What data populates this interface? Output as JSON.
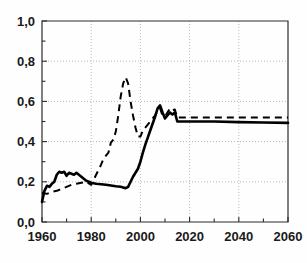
{
  "chart_data": {
    "type": "line",
    "title": "",
    "xlabel": "",
    "ylabel": "",
    "xlim": [
      1960,
      2060
    ],
    "ylim": [
      0.0,
      1.0
    ],
    "grid": true,
    "legend": "none",
    "decimal_separator": ",",
    "xticks": [
      1960,
      1980,
      2000,
      2020,
      2040,
      2060
    ],
    "xtick_labels": [
      "1960",
      "1980",
      "2000",
      "2020",
      "2040",
      "2060"
    ],
    "xminor_ticks": [
      1970,
      1990,
      2010,
      2030,
      2050
    ],
    "yticks": [
      0.0,
      0.2,
      0.4,
      0.6,
      0.8,
      1.0
    ],
    "ytick_labels": [
      "0,0",
      "0,2",
      "0,4",
      "0,6",
      "0,8",
      "1,0"
    ],
    "yminor_ticks": [
      0.1,
      0.3,
      0.5,
      0.7,
      0.9
    ],
    "gridlines_x": [
      1980,
      2000,
      2020,
      2040
    ],
    "gridlines_y": [
      0.2,
      0.4,
      0.6,
      0.8
    ],
    "series": [
      {
        "name": "solid-series",
        "style": "solid",
        "color": "#000000",
        "x": [
          1960,
          1961,
          1962,
          1963,
          1964,
          1965,
          1966,
          1967,
          1968,
          1969,
          1970,
          1971,
          1972,
          1973,
          1974,
          1975,
          1976,
          1977,
          1978,
          1979,
          1980,
          1982,
          1984,
          1986,
          1988,
          1990,
          1992,
          1993,
          1994,
          1995,
          1996,
          1997,
          1998,
          1999,
          2000,
          2001,
          2002,
          2003,
          2004,
          2005,
          2006,
          2007,
          2008,
          2009,
          2010,
          2011,
          2012,
          2013,
          2014,
          2015,
          2016,
          2020,
          2030,
          2040,
          2050,
          2060
        ],
        "y": [
          0.1,
          0.155,
          0.18,
          0.175,
          0.19,
          0.2,
          0.235,
          0.25,
          0.245,
          0.25,
          0.23,
          0.245,
          0.24,
          0.235,
          0.245,
          0.235,
          0.225,
          0.215,
          0.205,
          0.2,
          0.195,
          0.19,
          0.188,
          0.185,
          0.182,
          0.178,
          0.175,
          0.172,
          0.168,
          0.175,
          0.2,
          0.225,
          0.245,
          0.265,
          0.3,
          0.345,
          0.385,
          0.42,
          0.455,
          0.49,
          0.525,
          0.565,
          0.58,
          0.545,
          0.515,
          0.53,
          0.545,
          0.535,
          0.545,
          0.5,
          0.5,
          0.5,
          0.5,
          0.497,
          0.495,
          0.493
        ]
      },
      {
        "name": "dashed-series",
        "style": "dashed",
        "color": "#000000",
        "x": [
          1960,
          1962,
          1964,
          1966,
          1968,
          1970,
          1972,
          1974,
          1976,
          1978,
          1980,
          1982,
          1984,
          1985,
          1986,
          1987,
          1988,
          1989,
          1990,
          1991,
          1992,
          1993,
          1994,
          1995,
          1996,
          1997,
          1998,
          1999,
          2000,
          2001,
          2002,
          2003,
          2004,
          2005,
          2006,
          2007,
          2008,
          2009,
          2010,
          2011,
          2012,
          2013,
          2014,
          2015,
          2016,
          2020,
          2030,
          2040,
          2050,
          2060
        ],
        "y": [
          0.145,
          0.14,
          0.15,
          0.155,
          0.165,
          0.175,
          0.185,
          0.19,
          0.195,
          0.2,
          0.185,
          0.235,
          0.285,
          0.315,
          0.33,
          0.345,
          0.395,
          0.41,
          0.45,
          0.53,
          0.625,
          0.69,
          0.72,
          0.69,
          0.6,
          0.53,
          0.47,
          0.425,
          0.425,
          0.455,
          0.47,
          0.485,
          0.5,
          0.515,
          0.53,
          0.555,
          0.565,
          0.53,
          0.525,
          0.545,
          0.565,
          0.555,
          0.56,
          0.52,
          0.52,
          0.52,
          0.52,
          0.52,
          0.52,
          0.52
        ]
      }
    ]
  },
  "plot": {
    "left": 42,
    "right": 288,
    "top": 21,
    "bottom": 222
  }
}
